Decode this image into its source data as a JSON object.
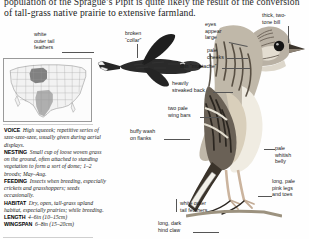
{
  "page": {
    "intro_line_1": "population of the Sprague’s Pipit is quite likely the result of the conversion",
    "intro_line_2": "of tall-grass native prairie to extensive farmland."
  },
  "range_map": {
    "name": "north-america-range-map",
    "legend_breeding": "breeding range",
    "legend_wintering": "wintering range"
  },
  "callouts": [
    {
      "id": "white-outer-tail-feathers-flight",
      "text": "white\nouter tail\nfeathers"
    },
    {
      "id": "broken-collar",
      "text": "broken\n“collar”"
    },
    {
      "id": "eyes-appear-large",
      "text": "eyes\nappear\nlarge"
    },
    {
      "id": "thick-two-tone-bill",
      "text": "thick, two-\ntone bill"
    },
    {
      "id": "pale-cheeks",
      "text": "pale\ncheeks"
    },
    {
      "id": "thin-mustache",
      "text": "thin “mustache”"
    },
    {
      "id": "heavily-streaked-back",
      "text": "heavily\nstreaked back"
    },
    {
      "id": "two-pale-wing-bars",
      "text": "two pale\nwing bars"
    },
    {
      "id": "buffy-wash-on-flanks",
      "text": "buffy wash\non flanks"
    },
    {
      "id": "pale-whitish-belly",
      "text": "pale\nwhitish\nbelly"
    },
    {
      "id": "long-pale-pink-legs-and-toes",
      "text": "long, pale\npink legs\nand toes"
    },
    {
      "id": "white-outer-tail-feathers-perched",
      "text": "white outer\ntail feathers"
    },
    {
      "id": "long-dark-hind-claw",
      "text": "long, dark\nhind claw"
    }
  ],
  "facts": [
    {
      "key": "VOICE",
      "value": "High squeeek; repetitive series of szee-szee-szee, usually given during aerial displays."
    },
    {
      "key": "NESTING",
      "value": "Small cup of loose woven grass on the ground, often attached to standing vegetation to form a sort of dome; 1–2 broods; May–Aug."
    },
    {
      "key": "FEEDING",
      "value": "Insects when breeding, especially crickets and grasshoppers; seeds occasionally."
    },
    {
      "key": "HABITAT",
      "value": "Dry, open, tall-grass upland habitat, especially prairies; while breeding."
    },
    {
      "key": "LENGTH",
      "value": "4–6in (10–15cm)"
    },
    {
      "key": "WINGSPAN",
      "value": "6–8in (15–20cm)"
    }
  ],
  "colors": {
    "breeding": "#6d6d6d",
    "wintering": "#9e9e9e",
    "text": "#1a1a1a",
    "leader": "#555555"
  }
}
